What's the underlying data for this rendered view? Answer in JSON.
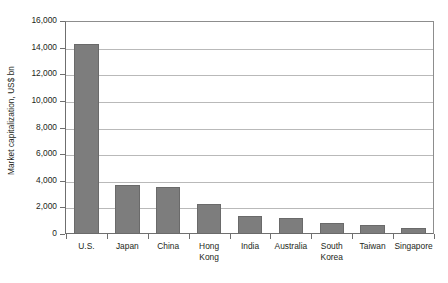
{
  "chart_data": {
    "type": "bar",
    "title": "",
    "subtitle": "",
    "xlabel": "",
    "ylabel": "Market capitalization, US$ bn",
    "categories": [
      "U.S.",
      "Japan",
      "China",
      "Hong Kong",
      "India",
      "Australia",
      "South Korea",
      "Taiwan",
      "Singapore"
    ],
    "values": [
      14300,
      3650,
      3500,
      2250,
      1330,
      1230,
      810,
      650,
      420
    ],
    "ylim": [
      0,
      16000
    ],
    "ytick_values": [
      0,
      2000,
      4000,
      6000,
      8000,
      10000,
      12000,
      14000,
      16000
    ],
    "ytick_labels": [
      "0",
      "2,000",
      "4,000",
      "6,000",
      "8,000",
      "10,000",
      "12,000",
      "14,000",
      "16,000"
    ],
    "grid": true,
    "grid_axis": "y",
    "legend": false,
    "legend_position": "none",
    "bar_color": "#7d7d7d",
    "bar_border_color": "#6a6a6a",
    "grid_color": "#b9b9b9",
    "axis_color": "#6f6f6f",
    "text_color": "#231f20",
    "background_color": "#ffffff"
  }
}
